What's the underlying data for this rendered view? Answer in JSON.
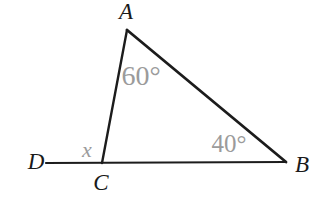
{
  "diagram": {
    "background_color": "#ffffff",
    "line_color": "#1c1c1c",
    "vertex_label_color": "#1a1a1a",
    "angle_label_color": "#9b9b9b",
    "vertices": {
      "A": "A",
      "B": "B",
      "C": "C",
      "D": "D"
    },
    "angles": {
      "at_A": "60°",
      "at_B": "40°",
      "exterior_at_C": "x"
    }
  }
}
